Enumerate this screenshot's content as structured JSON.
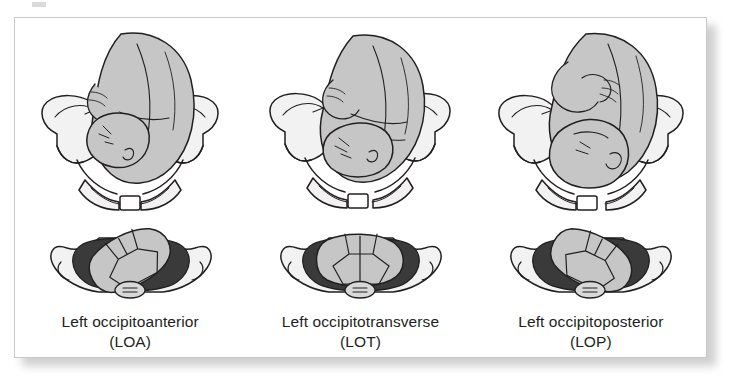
{
  "figure": {
    "kind": "medical-illustration",
    "colors": {
      "page_background": "#ffffff",
      "plate_background": "#ffffff",
      "plate_border": "#c9c9c9",
      "plate_shadow": "#a8a8a8",
      "ink_outline": "#231f20",
      "fetus_fill": "#c6c6c6",
      "fetus_fill_shade": "#b3b3b3",
      "pelvis_fill": "#f2f2f2",
      "pelvis_fill_shade": "#d8d8d8",
      "cavity_shadow": "#3a3a3a",
      "skull_plate_fill": "#c6c6c6",
      "caption_text": "#231f20"
    }
  },
  "panels": [
    {
      "id": "loa",
      "name": "left-occipitoanterior",
      "caption_line1": "Left occipitoanterior",
      "caption_line2": "(LOA)",
      "abbreviation": "LOA",
      "upper_view_label": "fetus in maternal pelvis, anterior view",
      "lower_view_label": "fetal skull at pelvic outlet, inferior view",
      "skull_rotation_deg": -28
    },
    {
      "id": "lot",
      "name": "left-occipitotransverse",
      "caption_line1": "Left occipitotransverse",
      "caption_line2": "(LOT)",
      "abbreviation": "LOT",
      "upper_view_label": "fetus in maternal pelvis, anterior view",
      "lower_view_label": "fetal skull at pelvic outlet, inferior view",
      "skull_rotation_deg": 0
    },
    {
      "id": "lop",
      "name": "left-occipitoposterior",
      "caption_line1": "Left occipitoposterior",
      "caption_line2": "(LOP)",
      "abbreviation": "LOP",
      "upper_view_label": "fetus in maternal pelvis, anterior view",
      "lower_view_label": "fetal skull at pelvic outlet, inferior view",
      "skull_rotation_deg": 26
    }
  ]
}
